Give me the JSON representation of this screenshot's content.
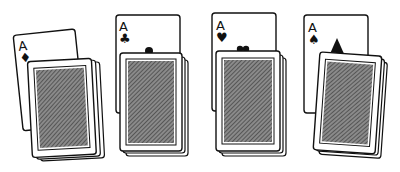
{
  "illustration": {
    "description": "Four aces each partially hidden behind a face-down deck",
    "groups": [
      {
        "rank": "A",
        "suit": "diamonds",
        "suit_glyph": "♦",
        "ace_tilt": -6,
        "deck_tilt": -4
      },
      {
        "rank": "A",
        "suit": "clubs",
        "suit_glyph": "♣",
        "ace_tilt": -1,
        "deck_tilt": 0
      },
      {
        "rank": "A",
        "suit": "hearts",
        "suit_glyph": "♥",
        "ace_tilt": 1,
        "deck_tilt": 1
      },
      {
        "rank": "A",
        "suit": "spades",
        "suit_glyph": "♠",
        "ace_tilt": 0,
        "deck_tilt": 4
      }
    ],
    "colors": {
      "ink": "#111111",
      "paper": "#ffffff",
      "hatch": "#555555"
    }
  }
}
